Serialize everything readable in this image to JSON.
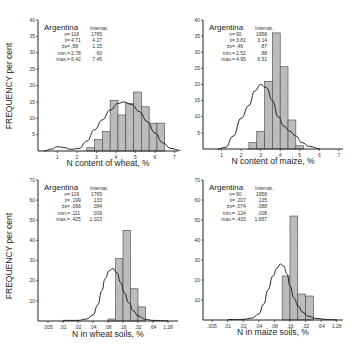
{
  "y_axis_label": "FREQUENCY per cent",
  "chart_data": [
    {
      "id": "wheat-grain",
      "type": "bar",
      "title": "",
      "xlabel": "N content of wheat, %",
      "ylabel": "FREQUENCY per cent",
      "x_ticks": [
        "1",
        "2",
        "3",
        "4",
        "5",
        "6",
        "7"
      ],
      "y_ticks": [
        "5",
        "10",
        "15",
        "20",
        "25",
        "30",
        "35",
        "40"
      ],
      "ylim": [
        0,
        40
      ],
      "xlim": [
        0,
        7.3
      ],
      "legend": {
        "country": "Argentina",
        "reference": "Internat."
      },
      "stats": [
        {
          "label": "n=",
          "argentina": "118",
          "international": "1765"
        },
        {
          "label": "x̄=",
          "argentina": "4.71",
          "international": "4.27"
        },
        {
          "label": "±s=",
          "argentina": ".88",
          "international": "1.15"
        },
        {
          "label": "min.=",
          "argentina": "2.78",
          "international": ".60"
        },
        {
          "label": "max.=",
          "argentina": "6.42",
          "international": "7.45"
        }
      ],
      "bins": [
        {
          "x0": 2.5,
          "x1": 2.9,
          "value": 1
        },
        {
          "x0": 2.9,
          "x1": 3.3,
          "value": 3.5
        },
        {
          "x0": 3.3,
          "x1": 3.7,
          "value": 6
        },
        {
          "x0": 3.7,
          "x1": 4.1,
          "value": 15.5
        },
        {
          "x0": 4.1,
          "x1": 4.5,
          "value": 11
        },
        {
          "x0": 4.5,
          "x1": 4.9,
          "value": 14.5
        },
        {
          "x0": 4.9,
          "x1": 5.3,
          "value": 18
        },
        {
          "x0": 5.3,
          "x1": 5.7,
          "value": 13.5
        },
        {
          "x0": 5.7,
          "x1": 6.1,
          "value": 8.5
        },
        {
          "x0": 6.1,
          "x1": 6.5,
          "value": 8.5
        }
      ],
      "curve_label": "International distribution",
      "curve": [
        [
          0.3,
          0
        ],
        [
          0.7,
          0.6
        ],
        [
          1.0,
          1.3
        ],
        [
          1.3,
          1.1
        ],
        [
          1.7,
          0.5
        ],
        [
          2.1,
          0.8
        ],
        [
          2.5,
          3
        ],
        [
          2.9,
          6.5
        ],
        [
          3.3,
          9.5
        ],
        [
          3.7,
          12.5
        ],
        [
          4.1,
          14.5
        ],
        [
          4.4,
          15
        ],
        [
          4.8,
          14.2
        ],
        [
          5.2,
          12
        ],
        [
          5.6,
          9
        ],
        [
          6.0,
          5.5
        ],
        [
          6.4,
          2.5
        ],
        [
          6.8,
          0.8
        ],
        [
          7.3,
          0.2
        ]
      ]
    },
    {
      "id": "maize-grain",
      "type": "bar",
      "title": "",
      "xlabel": "N content of maize, %",
      "ylabel": "",
      "x_ticks": [
        "1",
        "2",
        "3",
        "4",
        "5",
        "6",
        "7"
      ],
      "y_ticks": [
        "5",
        "10",
        "15",
        "20",
        "25",
        "30",
        "35",
        "40"
      ],
      "ylim": [
        0,
        40
      ],
      "xlim": [
        0,
        7.3
      ],
      "legend": {
        "country": "Argentina",
        "reference": "Internat."
      },
      "stats": [
        {
          "label": "n=",
          "argentina": "90",
          "international": "1958"
        },
        {
          "label": "x̄=",
          "argentina": "3.81",
          "international": "3.14"
        },
        {
          "label": "±s=",
          "argentina": ".46",
          "international": ".87"
        },
        {
          "label": "min.=",
          "argentina": "2.52",
          "international": ".88"
        },
        {
          "label": "max.=",
          "argentina": "4.95",
          "international": "6.51"
        }
      ],
      "bins": [
        {
          "x0": 2.4,
          "x1": 2.8,
          "value": 2
        },
        {
          "x0": 2.8,
          "x1": 3.2,
          "value": 5.5
        },
        {
          "x0": 3.2,
          "x1": 3.6,
          "value": 21
        },
        {
          "x0": 3.6,
          "x1": 4.0,
          "value": 36
        },
        {
          "x0": 4.0,
          "x1": 4.4,
          "value": 25.5
        },
        {
          "x0": 4.4,
          "x1": 4.8,
          "value": 9
        },
        {
          "x0": 4.8,
          "x1": 5.2,
          "value": 1
        }
      ],
      "curve_label": "International distribution",
      "curve": [
        [
          0.8,
          0
        ],
        [
          1.2,
          0.5
        ],
        [
          1.6,
          4
        ],
        [
          2.0,
          9.5
        ],
        [
          2.4,
          13.5
        ],
        [
          2.7,
          18
        ],
        [
          3.0,
          20
        ],
        [
          3.3,
          19
        ],
        [
          3.6,
          15
        ],
        [
          3.9,
          10
        ],
        [
          4.2,
          7
        ],
        [
          4.5,
          5.5
        ],
        [
          4.8,
          4
        ],
        [
          5.1,
          2
        ],
        [
          5.5,
          0.8
        ],
        [
          6.0,
          0.1
        ]
      ]
    },
    {
      "id": "wheat-soils",
      "type": "bar",
      "title": "",
      "xlabel": "N in wheat soils, %",
      "ylabel": "FREQUENCY per cent",
      "x_scale": "log2",
      "x_ticks": [
        ".005",
        ".01",
        ".02",
        ".04",
        ".08",
        ".16",
        ".32",
        ".64",
        "1.28"
      ],
      "y_ticks": [
        "10",
        "20",
        "30",
        "40",
        "50",
        "60",
        "70"
      ],
      "ylim": [
        0,
        70
      ],
      "legend": {
        "country": "Argentina",
        "reference": "Internat."
      },
      "stats": [
        {
          "label": "n=",
          "argentina": "119",
          "international": "1765"
        },
        {
          "label": "x̄=",
          "argentina": ".199",
          "international": ".133"
        },
        {
          "label": "±s=",
          "argentina": ".066",
          "international": ".084"
        },
        {
          "label": "min.=",
          "argentina": ".111",
          "international": ".009"
        },
        {
          "label": "max.=",
          "argentina": ".425",
          "international": "1.023"
        }
      ],
      "bins": [
        {
          "x0": 0.08,
          "x1": 0.113,
          "value": 1
        },
        {
          "x0": 0.113,
          "x1": 0.16,
          "value": 31
        },
        {
          "x0": 0.16,
          "x1": 0.226,
          "value": 45
        },
        {
          "x0": 0.226,
          "x1": 0.32,
          "value": 16
        },
        {
          "x0": 0.32,
          "x1": 0.453,
          "value": 7
        }
      ],
      "curve_label": "International distribution",
      "curve": [
        [
          0.01,
          0.3
        ],
        [
          0.02,
          0.3
        ],
        [
          0.03,
          1
        ],
        [
          0.04,
          3
        ],
        [
          0.05,
          8
        ],
        [
          0.06,
          15
        ],
        [
          0.07,
          21
        ],
        [
          0.085,
          25
        ],
        [
          0.1,
          26
        ],
        [
          0.12,
          24
        ],
        [
          0.145,
          19
        ],
        [
          0.17,
          14
        ],
        [
          0.21,
          9
        ],
        [
          0.26,
          5
        ],
        [
          0.32,
          2.5
        ],
        [
          0.45,
          0.8
        ],
        [
          0.64,
          0.3
        ],
        [
          1.28,
          0.1
        ]
      ]
    },
    {
      "id": "maize-soils",
      "type": "bar",
      "title": "",
      "xlabel": "N in maize soils, %",
      "ylabel": "",
      "x_scale": "log2",
      "x_ticks": [
        ".005",
        ".01",
        ".02",
        ".04",
        ".08",
        ".16",
        ".32",
        ".64",
        "1.28"
      ],
      "y_ticks": [
        "10",
        "20",
        "30",
        "40",
        "50",
        "60",
        "70"
      ],
      "ylim": [
        0,
        70
      ],
      "legend": {
        "country": "Argentina",
        "reference": "Internat."
      },
      "stats": [
        {
          "label": "n=",
          "argentina": "90",
          "international": "1958"
        },
        {
          "label": "x̄=",
          "argentina": ".207",
          "international": ".135"
        },
        {
          "label": "±s=",
          "argentina": ".074",
          "international": ".088"
        },
        {
          "label": "min.=",
          "argentina": ".124",
          "international": ".008"
        },
        {
          "label": "max.=",
          "argentina": ".433",
          "international": "1.657"
        }
      ],
      "bins": [
        {
          "x0": 0.113,
          "x1": 0.16,
          "value": 22
        },
        {
          "x0": 0.16,
          "x1": 0.226,
          "value": 52
        },
        {
          "x0": 0.226,
          "x1": 0.32,
          "value": 13
        },
        {
          "x0": 0.32,
          "x1": 0.453,
          "value": 12
        }
      ],
      "curve_label": "International distribution",
      "curve": [
        [
          0.01,
          0.2
        ],
        [
          0.02,
          0.3
        ],
        [
          0.03,
          1
        ],
        [
          0.04,
          3
        ],
        [
          0.05,
          8
        ],
        [
          0.06,
          15
        ],
        [
          0.075,
          22
        ],
        [
          0.09,
          26
        ],
        [
          0.105,
          28
        ],
        [
          0.12,
          27
        ],
        [
          0.14,
          23
        ],
        [
          0.16,
          17
        ],
        [
          0.19,
          11
        ],
        [
          0.23,
          7
        ],
        [
          0.28,
          4
        ],
        [
          0.35,
          2
        ],
        [
          0.5,
          0.8
        ],
        [
          0.8,
          0.3
        ],
        [
          1.28,
          0.1
        ]
      ]
    }
  ]
}
